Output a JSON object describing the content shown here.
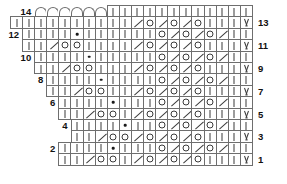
{
  "chart": {
    "type": "knitting-chart",
    "total_rows": 14,
    "cell_width": 13.1,
    "cell_height": 12.4,
    "grid_right_edge": 253,
    "legend_symbols": {
      "knit": "|",
      "purl": "•",
      "yarn_over": "O",
      "decrease": "/",
      "slip": "V",
      "bind_off": "⌒"
    },
    "row_numbers_left": [
      14,
      12,
      10,
      8,
      6,
      4,
      2
    ],
    "row_numbers_right": [
      13,
      11,
      9,
      7,
      5,
      3,
      1
    ],
    "rows": [
      {
        "number": 14,
        "label_side": "left",
        "label": "14",
        "indent": 0,
        "cells": [
          "arc",
          "arc",
          "arc",
          "arc",
          "arc",
          "arc",
          "knit",
          "knit",
          "knit",
          "knit",
          "knit",
          "knit",
          "knit",
          "knit",
          "knit",
          "knit",
          "knit",
          "knit"
        ]
      },
      {
        "number": 13,
        "label_side": "right",
        "label": "13",
        "indent": 0,
        "cells": [
          "knit",
          "knit",
          "knit",
          "knit",
          "knit",
          "knit",
          "knit",
          "knit",
          "knit",
          "knit",
          "dec",
          "yo",
          "dec",
          "yo",
          "dec",
          "yo",
          "knit",
          "knit",
          "knit",
          "v"
        ]
      },
      {
        "number": 12,
        "label_side": "left",
        "label": "12",
        "indent": 1,
        "cells": [
          "knit",
          "knit",
          "knit",
          "knit",
          "purl",
          "knit",
          "knit",
          "knit",
          "knit",
          "knit",
          "knit",
          "yo",
          "dec",
          "yo",
          "dec",
          "yo",
          "dec",
          "knit",
          "knit"
        ]
      },
      {
        "number": 11,
        "label_side": "right",
        "label": "11",
        "indent": 1,
        "cells": [
          "knit",
          "knit",
          "dec",
          "yo",
          "yo",
          "knit",
          "knit",
          "knit",
          "knit",
          "dec",
          "yo",
          "dec",
          "yo",
          "dec",
          "yo",
          "knit",
          "knit",
          "knit",
          "v"
        ]
      },
      {
        "number": 10,
        "label_side": "left",
        "label": "10",
        "indent": 2,
        "cells": [
          "knit",
          "knit",
          "knit",
          "knit",
          "purl",
          "knit",
          "knit",
          "knit",
          "knit",
          "knit",
          "yo",
          "dec",
          "yo",
          "dec",
          "yo",
          "dec",
          "knit",
          "knit"
        ]
      },
      {
        "number": 9,
        "label_side": "right",
        "label": "9",
        "indent": 2,
        "cells": [
          "knit",
          "knit",
          "dec",
          "yo",
          "yo",
          "knit",
          "knit",
          "knit",
          "dec",
          "yo",
          "dec",
          "yo",
          "dec",
          "yo",
          "knit",
          "knit",
          "knit",
          "v"
        ]
      },
      {
        "number": 8,
        "label_side": "left",
        "label": "8",
        "indent": 3,
        "cells": [
          "knit",
          "knit",
          "knit",
          "knit",
          "purl",
          "knit",
          "knit",
          "knit",
          "knit",
          "yo",
          "dec",
          "yo",
          "dec",
          "yo",
          "dec",
          "knit",
          "knit"
        ]
      },
      {
        "number": 7,
        "label_side": "right",
        "label": "7",
        "indent": 3,
        "cells": [
          "knit",
          "knit",
          "dec",
          "yo",
          "yo",
          "knit",
          "knit",
          "dec",
          "yo",
          "dec",
          "yo",
          "dec",
          "yo",
          "knit",
          "knit",
          "knit",
          "v"
        ]
      },
      {
        "number": 6,
        "label_side": "left",
        "label": "6",
        "indent": 4,
        "cells": [
          "knit",
          "knit",
          "knit",
          "knit",
          "purl",
          "knit",
          "knit",
          "knit",
          "yo",
          "dec",
          "yo",
          "dec",
          "yo",
          "dec",
          "knit",
          "knit"
        ]
      },
      {
        "number": 5,
        "label_side": "right",
        "label": "5",
        "indent": 4,
        "cells": [
          "knit",
          "knit",
          "dec",
          "yo",
          "yo",
          "knit",
          "dec",
          "yo",
          "dec",
          "yo",
          "dec",
          "yo",
          "knit",
          "knit",
          "knit",
          "v"
        ]
      },
      {
        "number": 4,
        "label_side": "left",
        "label": "4",
        "indent": 5,
        "cells": [
          "knit",
          "knit",
          "knit",
          "knit",
          "purl",
          "knit",
          "knit",
          "yo",
          "dec",
          "yo",
          "dec",
          "yo",
          "dec",
          "knit",
          "knit"
        ]
      },
      {
        "number": 3,
        "label_side": "right",
        "label": "3",
        "indent": 5,
        "cells": [
          "knit",
          "knit",
          "dec",
          "yo",
          "yo",
          "dec",
          "yo",
          "dec",
          "yo",
          "dec",
          "yo",
          "knit",
          "knit",
          "knit",
          "v"
        ]
      },
      {
        "number": 2,
        "label_side": "left",
        "label": "2",
        "indent": 6,
        "cells": [
          "knit",
          "knit",
          "knit",
          "knit",
          "purl",
          "knit",
          "knit",
          "knit",
          "yo",
          "dec",
          "yo",
          "dec",
          "yo",
          "dec",
          "knit",
          "knit"
        ]
      },
      {
        "number": 1,
        "label_side": "right",
        "label": "1",
        "indent": 6,
        "cells": [
          "knit",
          "knit",
          "dec",
          "yo",
          "yo",
          "knit",
          "dec",
          "yo",
          "dec",
          "yo",
          "dec",
          "yo",
          "knit",
          "knit",
          "knit",
          "v"
        ]
      }
    ]
  }
}
